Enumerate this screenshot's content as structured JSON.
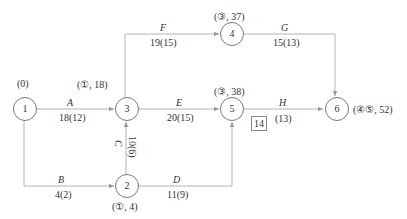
{
  "diagram": {
    "type": "double-code network (activity-on-arrow) with time-cost parameters",
    "nodes": [
      {
        "id": "1",
        "label": "1",
        "annotation": "(0)"
      },
      {
        "id": "2",
        "label": "2",
        "annotation": "(①, 4)"
      },
      {
        "id": "3",
        "label": "3",
        "annotation": "(①, 18)"
      },
      {
        "id": "4",
        "label": "4",
        "annotation": "(③, 37)"
      },
      {
        "id": "5",
        "label": "5",
        "annotation": "(③, 38)"
      },
      {
        "id": "6",
        "label": "6",
        "annotation": "(④⑤, 52)"
      }
    ],
    "activities": [
      {
        "name": "A",
        "from": "1",
        "to": "3",
        "duration": "18(12)"
      },
      {
        "name": "B",
        "from": "1",
        "to": "2",
        "duration": "4(2)"
      },
      {
        "name": "C",
        "from": "2",
        "to": "3",
        "duration": "10(6)"
      },
      {
        "name": "D",
        "from": "2",
        "to": "5",
        "duration": "11(9)"
      },
      {
        "name": "E",
        "from": "3",
        "to": "5",
        "duration": "20(15)"
      },
      {
        "name": "F",
        "from": "3",
        "to": "4",
        "duration": "19(15)"
      },
      {
        "name": "G",
        "from": "4",
        "to": "6",
        "duration": "15(13)"
      },
      {
        "name": "H",
        "from": "5",
        "to": "6",
        "duration": "(13)",
        "boxed_value": "14"
      }
    ]
  }
}
